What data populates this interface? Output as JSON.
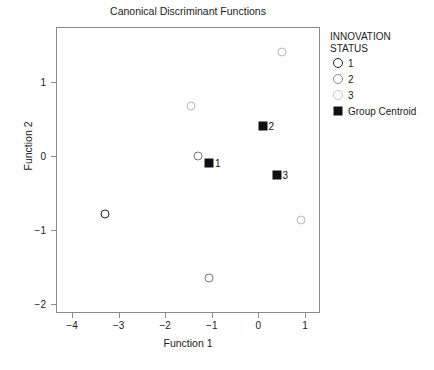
{
  "chart_data": {
    "type": "scatter",
    "title": "Canonical Discriminant Functions",
    "xlabel": "Function 1",
    "ylabel": "Function 2",
    "xlim": [
      -4.35,
      1.33
    ],
    "ylim": [
      -2.3,
      1.57
    ],
    "xticks": [
      -4,
      -3,
      -2,
      -1,
      0,
      1
    ],
    "xticklabels": [
      "-4",
      "-3",
      "-2",
      "-1",
      "0",
      "1"
    ],
    "yticks": [
      1,
      0,
      -1,
      -2
    ],
    "yticklabels": [
      "1",
      "0",
      "-1",
      "-2"
    ],
    "grid": false,
    "legend_position": "right",
    "series": [
      {
        "name": "1",
        "marker": "open-circle",
        "color": "#222222",
        "line_width": 1.6,
        "size": 9,
        "points": [
          {
            "x": -3.3,
            "y": -0.78
          }
        ]
      },
      {
        "name": "2",
        "marker": "open-circle",
        "color": "#777777",
        "line_width": 1.3,
        "size": 9,
        "points": [
          {
            "x": -1.3,
            "y": 0.0
          },
          {
            "x": -1.05,
            "y": -1.65
          }
        ]
      },
      {
        "name": "3",
        "marker": "open-circle",
        "color": "#b8b8b8",
        "line_width": 1.2,
        "size": 9,
        "points": [
          {
            "x": 0.5,
            "y": 1.4
          },
          {
            "x": -1.45,
            "y": 0.67
          },
          {
            "x": 0.92,
            "y": -0.87
          }
        ]
      },
      {
        "name": "Group Centroid",
        "marker": "filled-square",
        "color": "#111111",
        "size": 9,
        "points": [
          {
            "x": -1.05,
            "y": -0.1,
            "label": "1"
          },
          {
            "x": 0.1,
            "y": 0.4,
            "label": "2"
          },
          {
            "x": 0.4,
            "y": -0.25,
            "label": "3"
          }
        ]
      }
    ]
  },
  "legend": {
    "title_line1": "INNOVATION",
    "title_line2": "STATUS",
    "entries": [
      {
        "label": "1",
        "marker": "open-circle",
        "color": "#222222",
        "line_width": 1.8,
        "size": 10
      },
      {
        "label": "2",
        "marker": "open-circle",
        "color": "#888888",
        "line_width": 1.4,
        "size": 10
      },
      {
        "label": "3",
        "marker": "open-circle",
        "color": "#c4c4c4",
        "line_width": 1.3,
        "size": 10
      },
      {
        "label": "Group Centroid",
        "marker": "filled-square",
        "color": "#111111",
        "size": 9
      }
    ]
  },
  "colors": {
    "frame": "#8a8a8a",
    "text": "#222222",
    "centroid": "#111111",
    "background": "#ffffff"
  }
}
